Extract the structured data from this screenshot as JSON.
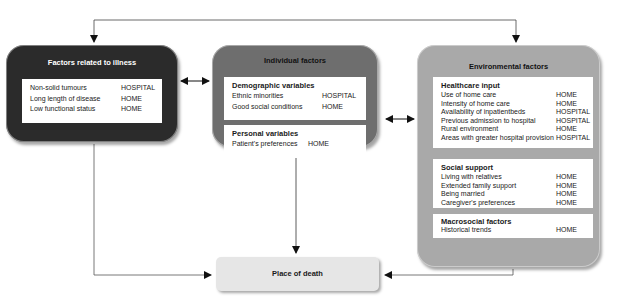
{
  "groups": {
    "illness": {
      "title": "Factors related to illness",
      "color": "#2b2b2b",
      "items": [
        {
          "label": "Non-solid tumours",
          "value": "HOSPITAL"
        },
        {
          "label": "Long length of disease",
          "value": "HOME"
        },
        {
          "label": "Low functional status",
          "value": "HOME"
        }
      ]
    },
    "individual": {
      "title": "Individual factors",
      "color": "#6e6e6e",
      "sections": [
        {
          "heading": "Demographic variables",
          "items": [
            {
              "label": "Ethnic minorities",
              "value": "HOSPITAL"
            },
            {
              "label": "Good social conditions",
              "value": "HOME"
            }
          ]
        },
        {
          "heading": "Personal variables",
          "items": [
            {
              "label": "Patient's preferences",
              "value": "HOME"
            }
          ]
        }
      ]
    },
    "environmental": {
      "title": "Environmental factors",
      "color": "#a9a9a9",
      "sections": [
        {
          "heading": "Healthcare input",
          "items": [
            {
              "label": "Use of home care",
              "value": "HOME"
            },
            {
              "label": "Intensity of home care",
              "value": "HOME"
            },
            {
              "label": "Availability of inpatientbeds",
              "value": "HOSPITAL"
            },
            {
              "label": "Previous admission to hospital",
              "value": "HOSPITAL"
            },
            {
              "label": "Rural environment",
              "value": "HOME"
            },
            {
              "label": "Areas with greater hospital provision",
              "value": "HOSPITAL"
            }
          ]
        },
        {
          "heading": "Social support",
          "items": [
            {
              "label": "Living with relatives",
              "value": "HOME"
            },
            {
              "label": "Extended family support",
              "value": "HOME"
            },
            {
              "label": "Being married",
              "value": "HOME"
            },
            {
              "label": "Caregiver's preferences",
              "value": "HOME"
            }
          ]
        },
        {
          "heading": "Macrosocial factors",
          "items": [
            {
              "label": "Historical trends",
              "value": "HOME"
            }
          ]
        }
      ]
    }
  },
  "outcome": {
    "label": "Place of death",
    "color": "#e6e6e6"
  },
  "connections": [
    {
      "from": "illness",
      "to": "individual",
      "type": "bidirectional"
    },
    {
      "from": "individual",
      "to": "environmental",
      "type": "bidirectional"
    },
    {
      "from": "illness",
      "to": "environmental",
      "type": "bidirectional-top"
    },
    {
      "from": "illness",
      "to": "outcome",
      "type": "arrow"
    },
    {
      "from": "individual",
      "to": "outcome",
      "type": "arrow"
    },
    {
      "from": "environmental",
      "to": "outcome",
      "type": "arrow"
    }
  ]
}
